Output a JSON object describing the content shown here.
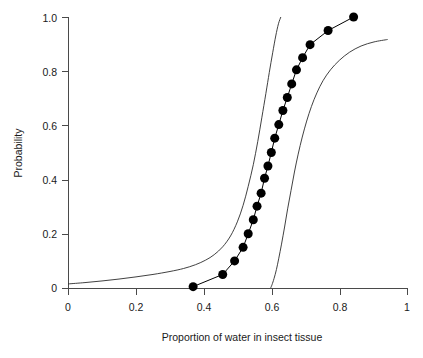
{
  "chart_data": {
    "type": "line",
    "title": "",
    "subtitle": "",
    "xlabel": "Proportion of water in insect tissue",
    "ylabel": "Probability",
    "xlim": [
      0,
      1
    ],
    "ylim": [
      0,
      1
    ],
    "grid": false,
    "legend": null,
    "xticks": [
      0,
      0.2,
      0.4,
      0.6,
      0.8,
      1
    ],
    "xticklabels": [
      "0",
      "0.2",
      "0.4",
      "0.6",
      "0.8",
      "1"
    ],
    "yticks": [
      0,
      0.2,
      0.4,
      0.6,
      0.8,
      1
    ],
    "yticklabels": [
      "0",
      "0.2",
      "0.4",
      "0.6",
      "0.8",
      "1.0"
    ],
    "series": [
      {
        "name": "fitted-probability",
        "style": "line-with-filled-circle-markers",
        "color": "#000000",
        "marker": "filled-circle",
        "marker_size_px": 9,
        "x": [
          0.368,
          0.455,
          0.49,
          0.515,
          0.53,
          0.545,
          0.556,
          0.568,
          0.578,
          0.588,
          0.598,
          0.608,
          0.62,
          0.632,
          0.645,
          0.658,
          0.672,
          0.69,
          0.712,
          0.765,
          0.84
        ],
        "y": [
          0.005,
          0.05,
          0.1,
          0.15,
          0.2,
          0.252,
          0.302,
          0.35,
          0.405,
          0.45,
          0.5,
          0.553,
          0.603,
          0.655,
          0.703,
          0.753,
          0.805,
          0.85,
          0.898,
          0.95,
          1.0
        ]
      },
      {
        "name": "upper-confidence-band",
        "style": "thin-line",
        "color": "#2b2b2b",
        "marker": "none",
        "x": [
          0.0,
          0.05,
          0.1,
          0.15,
          0.2,
          0.25,
          0.3,
          0.34,
          0.375,
          0.405,
          0.43,
          0.455,
          0.478,
          0.498,
          0.515,
          0.53,
          0.545,
          0.558,
          0.57,
          0.582,
          0.592,
          0.602,
          0.611,
          0.619,
          0.626
        ],
        "y": [
          0.015,
          0.02,
          0.026,
          0.033,
          0.041,
          0.05,
          0.061,
          0.072,
          0.086,
          0.103,
          0.123,
          0.152,
          0.192,
          0.244,
          0.305,
          0.375,
          0.455,
          0.54,
          0.628,
          0.718,
          0.795,
          0.868,
          0.93,
          0.975,
          1.0
        ]
      },
      {
        "name": "lower-confidence-band",
        "style": "thin-line",
        "color": "#2b2b2b",
        "marker": "none",
        "x": [
          0.596,
          0.6,
          0.606,
          0.613,
          0.62,
          0.628,
          0.637,
          0.646,
          0.656,
          0.666,
          0.677,
          0.689,
          0.702,
          0.716,
          0.732,
          0.75,
          0.772,
          0.798,
          0.828,
          0.862,
          0.9,
          0.94
        ],
        "y": [
          0.0,
          0.012,
          0.035,
          0.068,
          0.11,
          0.162,
          0.225,
          0.292,
          0.36,
          0.428,
          0.494,
          0.557,
          0.616,
          0.67,
          0.72,
          0.765,
          0.805,
          0.84,
          0.87,
          0.893,
          0.908,
          0.917
        ]
      }
    ]
  },
  "axes": {
    "x_title": "Proportion of water in insect tissue",
    "y_title": "Probability",
    "x_tick_labels": [
      "0",
      "0.2",
      "0.4",
      "0.6",
      "0.8",
      "1"
    ],
    "y_tick_labels": [
      "0",
      "0.2",
      "0.4",
      "0.6",
      "0.8",
      "1.0"
    ]
  },
  "style": {
    "background": "#ffffff",
    "axis_color": "#4a4a4a",
    "series_color": "#000000",
    "band_color": "#2b2b2b"
  }
}
